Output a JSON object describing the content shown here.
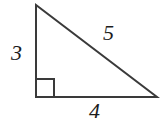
{
  "figure": {
    "name": "right-triangle-3-4-5",
    "type": "geometry-diagram",
    "background_color": "#ffffff",
    "stroke_color": "#3a3a3a",
    "stroke_width": 2,
    "label_color": "#1c1c1c",
    "vertices": {
      "top": {
        "x": 36,
        "y": 5
      },
      "bottom_left": {
        "x": 36,
        "y": 97
      },
      "bottom_right": {
        "x": 157,
        "y": 97
      }
    },
    "right_angle_marker": {
      "at_vertex": "bottom_left",
      "x": 37,
      "y": 79,
      "size": 18
    },
    "labels": {
      "vertical_leg": "3",
      "hypotenuse": "5",
      "horizontal_leg": "4"
    }
  }
}
